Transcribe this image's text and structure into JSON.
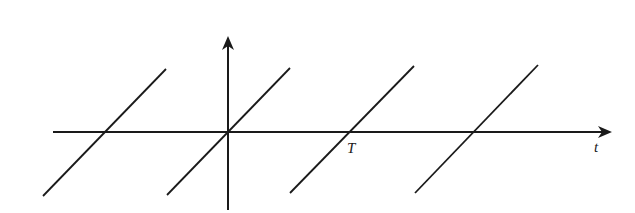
{
  "diagram": {
    "type": "sawtooth-wave",
    "stroke_color": "#1a1a1a",
    "background": "#ffffff",
    "axes": {
      "horizontal": {
        "x1": 53,
        "y": 132,
        "x2": 612,
        "label": "t",
        "label_pos": [
          594,
          140
        ]
      },
      "vertical": {
        "x": 228,
        "y1": 210,
        "y2": 36
      }
    },
    "ramps": [
      {
        "x1": 43,
        "y1": 196,
        "x2": 166,
        "y2": 69
      },
      {
        "x1": 167,
        "y1": 195,
        "x2": 290,
        "y2": 68
      },
      {
        "x1": 290,
        "y1": 193,
        "x2": 414,
        "y2": 66
      },
      {
        "x1": 415,
        "y1": 193,
        "x2": 538,
        "y2": 65
      }
    ],
    "period_label": {
      "text": "T",
      "pos": [
        347,
        141
      ]
    }
  }
}
